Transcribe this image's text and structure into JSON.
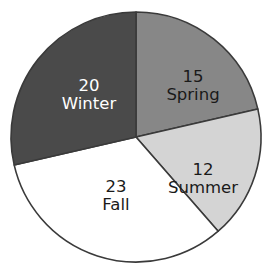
{
  "chart_data": {
    "type": "pie",
    "title": "",
    "subtitle": "",
    "xlabel": "",
    "ylabel": "",
    "legend_position": "none",
    "grid": false,
    "total": 70,
    "units": "count",
    "start_angle_deg": 0,
    "direction": "clockwise",
    "categories": [
      "Spring",
      "Summer",
      "Fall",
      "Winter"
    ],
    "values": [
      15,
      12,
      23,
      20
    ],
    "slices": [
      {
        "label": "Spring",
        "value": 15,
        "value_text": "15",
        "percent": 21.4,
        "start_angle_deg": 0,
        "end_angle_deg": 77.1,
        "fill": "#878787",
        "stroke": "#3a3a3a",
        "text_color": "#1a1a1a",
        "label_x": 193,
        "label_y": 86
      },
      {
        "label": "Summer",
        "value": 12,
        "value_text": "12",
        "percent": 17.1,
        "start_angle_deg": 77.1,
        "end_angle_deg": 138.9,
        "fill": "#d4d4d4",
        "stroke": "#3a3a3a",
        "text_color": "#1a1a1a",
        "label_x": 203,
        "label_y": 179
      },
      {
        "label": "Fall",
        "value": 23,
        "value_text": "23",
        "percent": 32.9,
        "start_angle_deg": 138.9,
        "end_angle_deg": 257.1,
        "fill": "#ffffff",
        "stroke": "#3a3a3a",
        "text_color": "#1a1a1a",
        "label_x": 116,
        "label_y": 196
      },
      {
        "label": "Winter",
        "value": 20,
        "value_text": "20",
        "percent": 28.6,
        "start_angle_deg": 257.1,
        "end_angle_deg": 360,
        "fill": "#4a4a4a",
        "stroke": "#3a3a3a",
        "text_color": "#ffffff",
        "label_x": 89,
        "label_y": 95
      }
    ],
    "geometry": {
      "center_x": 136,
      "center_y": 137,
      "radius": 125
    }
  },
  "artifacts": {
    "top_strip_text": "·  ·   ·  ·     ·  ·   ·"
  }
}
